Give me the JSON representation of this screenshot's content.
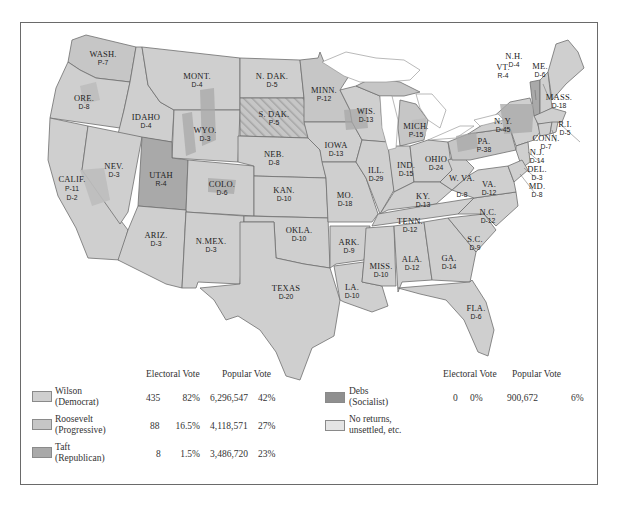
{
  "legend": {
    "left": {
      "headers": {
        "electoral": "Electoral Vote",
        "popular": "Popular Vote"
      },
      "rows": [
        {
          "name": "Wilson",
          "party": "(Democrat)",
          "color": "#cfcfcf",
          "electoral_votes": "435",
          "electoral_pct": "82%",
          "popular_votes": "6,296,547",
          "popular_pct": "42%"
        },
        {
          "name": "Roosevelt",
          "party": "(Progressive)",
          "color": "#c6c6c6",
          "electoral_votes": "88",
          "electoral_pct": "16.5%",
          "popular_votes": "4,118,571",
          "popular_pct": "27%"
        },
        {
          "name": "Taft",
          "party": "(Republican)",
          "color": "#a9a9a9",
          "electoral_votes": "8",
          "electoral_pct": "1.5%",
          "popular_votes": "3,486,720",
          "popular_pct": "23%"
        }
      ]
    },
    "right": {
      "headers": {
        "electoral": "Electoral Vote",
        "popular": "Popular Vote"
      },
      "rows": [
        {
          "name": "Debs",
          "party": "(Socialist)",
          "color": "#8f8f8f",
          "electoral_votes": "0",
          "electoral_pct": "0%",
          "popular_votes": "900,672",
          "popular_pct": "6%"
        },
        {
          "name": "No returns,",
          "party": "unsettled, etc.",
          "color": "#e4e4e4"
        }
      ]
    }
  },
  "states": [
    {
      "abbr": "WASH.",
      "vote": "P-7"
    },
    {
      "abbr": "ORE.",
      "vote": "D-8"
    },
    {
      "abbr": "CALIF.",
      "vote": "P-11",
      "vote2": "D-2"
    },
    {
      "abbr": "IDAHO",
      "vote": "D-4"
    },
    {
      "abbr": "NEV.",
      "vote": "D-3"
    },
    {
      "abbr": "MONT.",
      "vote": "D-4"
    },
    {
      "abbr": "WYO.",
      "vote": "D-3"
    },
    {
      "abbr": "UTAH",
      "vote": "R-4"
    },
    {
      "abbr": "COLO.",
      "vote": "D-6"
    },
    {
      "abbr": "ARIZ.",
      "vote": "D-3"
    },
    {
      "abbr": "N.MEX.",
      "vote": "D-3"
    },
    {
      "abbr": "N. DAK.",
      "vote": "D-5"
    },
    {
      "abbr": "S. DAK.",
      "vote": "P-5"
    },
    {
      "abbr": "NEB.",
      "vote": "D-8"
    },
    {
      "abbr": "KAN.",
      "vote": "D-10"
    },
    {
      "abbr": "OKLA.",
      "vote": "D-10"
    },
    {
      "abbr": "TEXAS",
      "vote": "D-20"
    },
    {
      "abbr": "MINN.",
      "vote": "P-12"
    },
    {
      "abbr": "IOWA",
      "vote": "D-13"
    },
    {
      "abbr": "MO.",
      "vote": "D-18"
    },
    {
      "abbr": "ARK.",
      "vote": "D-9"
    },
    {
      "abbr": "LA.",
      "vote": "D-10"
    },
    {
      "abbr": "WIS.",
      "vote": "D-13"
    },
    {
      "abbr": "ILL.",
      "vote": "D-29"
    },
    {
      "abbr": "MICH.",
      "vote": "P-15"
    },
    {
      "abbr": "IND.",
      "vote": "D-15"
    },
    {
      "abbr": "OHIO",
      "vote": "D-24"
    },
    {
      "abbr": "KY.",
      "vote": "D-13"
    },
    {
      "abbr": "TENN.",
      "vote": "D-12"
    },
    {
      "abbr": "MISS.",
      "vote": "D-10"
    },
    {
      "abbr": "ALA.",
      "vote": "D-12"
    },
    {
      "abbr": "GA.",
      "vote": "D-14"
    },
    {
      "abbr": "FLA.",
      "vote": "D-6"
    },
    {
      "abbr": "S.C.",
      "vote": "D-9"
    },
    {
      "abbr": "N.C.",
      "vote": "D-12"
    },
    {
      "abbr": "VA.",
      "vote": "D-12"
    },
    {
      "abbr": "W. VA.",
      "vote": "D-8"
    },
    {
      "abbr": "PA.",
      "vote": "P-38"
    },
    {
      "abbr": "N. Y.",
      "vote": "D-45"
    },
    {
      "abbr": "VT.",
      "vote": "R-4"
    },
    {
      "abbr": "N.H.",
      "vote": "D-4"
    },
    {
      "abbr": "ME.",
      "vote": "D-6"
    },
    {
      "abbr": "MASS.",
      "vote": "D-18"
    },
    {
      "abbr": "R.I.",
      "vote": "D-5"
    },
    {
      "abbr": "CONN.",
      "vote": "D-7"
    },
    {
      "abbr": "N.J.",
      "vote": "D-14"
    },
    {
      "abbr": "DEL.",
      "vote": "D-3"
    },
    {
      "abbr": "MD.",
      "vote": "D-8"
    }
  ]
}
